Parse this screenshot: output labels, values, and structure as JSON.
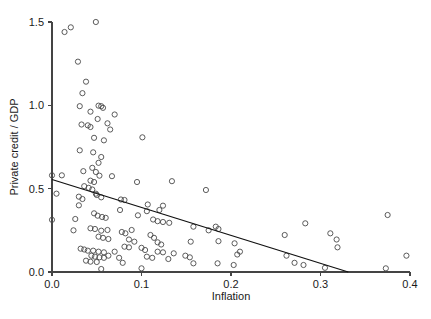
{
  "chart_data": {
    "type": "scatter",
    "title": "",
    "xlabel": "Inflation",
    "ylabel": "Private credit / GDP",
    "xlim": [
      0.0,
      0.4
    ],
    "ylim": [
      0.0,
      1.5
    ],
    "xticks": [
      0.0,
      0.1,
      0.2,
      0.3,
      0.4
    ],
    "xtick_labels": [
      "0.0",
      "0.1",
      "0.2",
      "0.3",
      "0.4"
    ],
    "yticks": [
      0.0,
      0.5,
      1.0,
      1.5
    ],
    "ytick_labels": [
      "0.0",
      "0.5",
      "1.0",
      "1.5"
    ],
    "grid": false,
    "legend": null,
    "marker": "open-circle",
    "marker_color": "#4a4a4a",
    "line_color": "#111111",
    "fit_line": {
      "type": "linear",
      "x_start": 0.0,
      "y_start": 0.555,
      "x_end": 0.331,
      "y_end": 0.0,
      "slope": -1.677,
      "intercept": 0.555
    },
    "points": [
      [
        0.0,
        0.58
      ],
      [
        0.0,
        0.313
      ],
      [
        0.005,
        0.47
      ],
      [
        0.014,
        1.44
      ],
      [
        0.021,
        1.468
      ],
      [
        0.049,
        1.5
      ],
      [
        0.029,
        1.262
      ],
      [
        0.038,
        1.142
      ],
      [
        0.034,
        1.073
      ],
      [
        0.031,
        0.995
      ],
      [
        0.043,
        0.962
      ],
      [
        0.052,
        0.998
      ],
      [
        0.055,
        0.995
      ],
      [
        0.057,
        0.985
      ],
      [
        0.07,
        0.945
      ],
      [
        0.062,
        0.892
      ],
      [
        0.033,
        0.885
      ],
      [
        0.04,
        0.88
      ],
      [
        0.043,
        0.87
      ],
      [
        0.051,
        0.918
      ],
      [
        0.065,
        0.855
      ],
      [
        0.047,
        0.805
      ],
      [
        0.058,
        0.79
      ],
      [
        0.101,
        0.808
      ],
      [
        0.031,
        0.73
      ],
      [
        0.046,
        0.718
      ],
      [
        0.055,
        0.69
      ],
      [
        0.052,
        0.655
      ],
      [
        0.035,
        0.605
      ],
      [
        0.045,
        0.625
      ],
      [
        0.049,
        0.6
      ],
      [
        0.053,
        0.578
      ],
      [
        0.067,
        0.575
      ],
      [
        0.011,
        0.58
      ],
      [
        0.043,
        0.548
      ],
      [
        0.047,
        0.54
      ],
      [
        0.095,
        0.54
      ],
      [
        0.134,
        0.545
      ],
      [
        0.172,
        0.492
      ],
      [
        0.036,
        0.515
      ],
      [
        0.041,
        0.505
      ],
      [
        0.045,
        0.495
      ],
      [
        0.049,
        0.47
      ],
      [
        0.05,
        0.462
      ],
      [
        0.055,
        0.448
      ],
      [
        0.03,
        0.452
      ],
      [
        0.034,
        0.438
      ],
      [
        0.077,
        0.435
      ],
      [
        0.081,
        0.432
      ],
      [
        0.03,
        0.4
      ],
      [
        0.107,
        0.405
      ],
      [
        0.124,
        0.398
      ],
      [
        0.12,
        0.372
      ],
      [
        0.106,
        0.365
      ],
      [
        0.076,
        0.372
      ],
      [
        0.047,
        0.352
      ],
      [
        0.051,
        0.338
      ],
      [
        0.056,
        0.33
      ],
      [
        0.06,
        0.325
      ],
      [
        0.026,
        0.318
      ],
      [
        0.096,
        0.34
      ],
      [
        0.113,
        0.315
      ],
      [
        0.118,
        0.305
      ],
      [
        0.124,
        0.3
      ],
      [
        0.131,
        0.295
      ],
      [
        0.158,
        0.272
      ],
      [
        0.175,
        0.25
      ],
      [
        0.183,
        0.272
      ],
      [
        0.186,
        0.258
      ],
      [
        0.024,
        0.25
      ],
      [
        0.043,
        0.262
      ],
      [
        0.048,
        0.258
      ],
      [
        0.055,
        0.248
      ],
      [
        0.062,
        0.252
      ],
      [
        0.078,
        0.24
      ],
      [
        0.082,
        0.232
      ],
      [
        0.089,
        0.252
      ],
      [
        0.052,
        0.212
      ],
      [
        0.057,
        0.205
      ],
      [
        0.063,
        0.198
      ],
      [
        0.086,
        0.195
      ],
      [
        0.092,
        0.182
      ],
      [
        0.11,
        0.222
      ],
      [
        0.114,
        0.205
      ],
      [
        0.118,
        0.178
      ],
      [
        0.122,
        0.165
      ],
      [
        0.081,
        0.152
      ],
      [
        0.086,
        0.148
      ],
      [
        0.1,
        0.145
      ],
      [
        0.104,
        0.132
      ],
      [
        0.155,
        0.182
      ],
      [
        0.186,
        0.185
      ],
      [
        0.204,
        0.172
      ],
      [
        0.032,
        0.14
      ],
      [
        0.036,
        0.135
      ],
      [
        0.04,
        0.128
      ],
      [
        0.046,
        0.128
      ],
      [
        0.052,
        0.122
      ],
      [
        0.058,
        0.118
      ],
      [
        0.07,
        0.122
      ],
      [
        0.044,
        0.098
      ],
      [
        0.048,
        0.092
      ],
      [
        0.053,
        0.088
      ],
      [
        0.058,
        0.085
      ],
      [
        0.063,
        0.098
      ],
      [
        0.038,
        0.068
      ],
      [
        0.043,
        0.062
      ],
      [
        0.05,
        0.06
      ],
      [
        0.075,
        0.085
      ],
      [
        0.079,
        0.055
      ],
      [
        0.106,
        0.092
      ],
      [
        0.112,
        0.085
      ],
      [
        0.118,
        0.122
      ],
      [
        0.124,
        0.118
      ],
      [
        0.13,
        0.078
      ],
      [
        0.136,
        0.112
      ],
      [
        0.149,
        0.098
      ],
      [
        0.154,
        0.088
      ],
      [
        0.158,
        0.052
      ],
      [
        0.185,
        0.052
      ],
      [
        0.203,
        0.042
      ],
      [
        0.207,
        0.105
      ],
      [
        0.21,
        0.122
      ],
      [
        0.055,
        0.018
      ],
      [
        0.1,
        0.022
      ],
      [
        0.26,
        0.222
      ],
      [
        0.262,
        0.098
      ],
      [
        0.271,
        0.055
      ],
      [
        0.281,
        0.042
      ],
      [
        0.283,
        0.292
      ],
      [
        0.305,
        0.025
      ],
      [
        0.311,
        0.232
      ],
      [
        0.318,
        0.195
      ],
      [
        0.319,
        0.148
      ],
      [
        0.375,
        0.342
      ],
      [
        0.373,
        0.022
      ],
      [
        0.396,
        0.098
      ]
    ]
  },
  "figure": {
    "width": 431,
    "height": 319,
    "background": "#ffffff",
    "plot_left_px": 52,
    "plot_right_px": 410,
    "plot_top_px": 22,
    "plot_bottom_px": 272
  }
}
